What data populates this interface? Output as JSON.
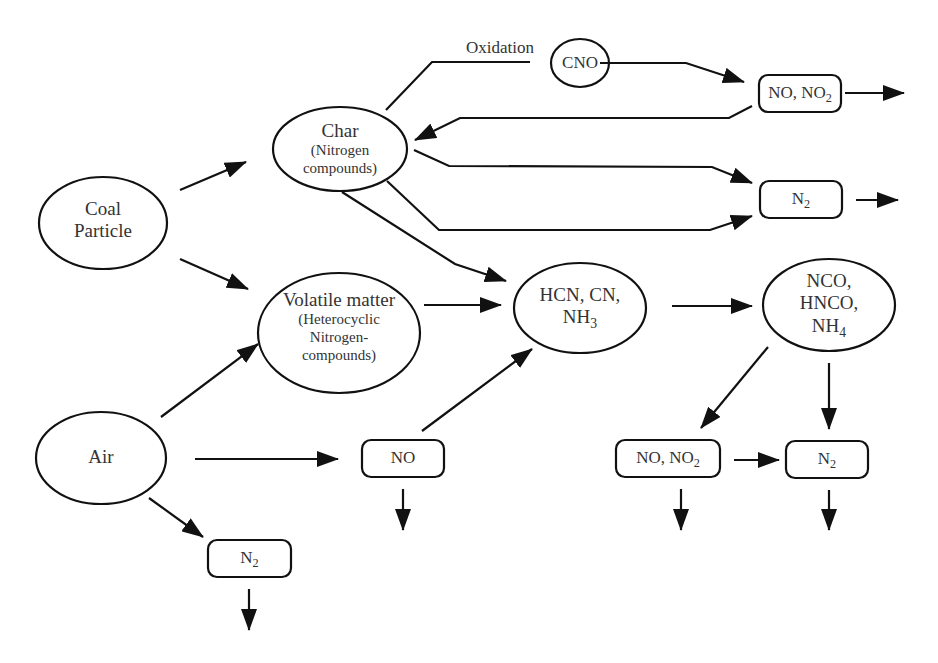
{
  "nodes": {
    "coal_particle": {
      "shape": "ellipse",
      "line1": "Coal",
      "line2": "Particle"
    },
    "air": {
      "shape": "ellipse",
      "line1": "Air"
    },
    "char": {
      "shape": "ellipse",
      "line1": "Char",
      "line2": "(Nitrogen",
      "line3": "compounds)"
    },
    "volatile": {
      "shape": "ellipse",
      "line1": "Volatile matter",
      "line2": "(Heterocyclic",
      "line3": "Nitrogen-",
      "line4": "compounds)"
    },
    "cno": {
      "shape": "ellipse",
      "line1": "CNO"
    },
    "hcn": {
      "shape": "ellipse",
      "line1": "HCN, CN,",
      "line2_base": "NH",
      "line2_sub": "3"
    },
    "nco": {
      "shape": "ellipse",
      "line1": "NCO,",
      "line2": "HNCO,",
      "line3_base": "NH",
      "line3_sub": "4"
    },
    "top_no_no2": {
      "shape": "rounded-box",
      "base": "NO, NO",
      "sub": "2"
    },
    "top_n2": {
      "shape": "rounded-box",
      "base": "N",
      "sub": "2"
    },
    "mid_no": {
      "shape": "rounded-box",
      "label": "NO"
    },
    "bottom_n2_left": {
      "shape": "rounded-box",
      "base": "N",
      "sub": "2"
    },
    "bottom_no_no2": {
      "shape": "rounded-box",
      "base": "NO, NO",
      "sub": "2"
    },
    "bottom_n2_right": {
      "shape": "rounded-box",
      "base": "N",
      "sub": "2"
    }
  },
  "edge_labels": {
    "oxidation": "Oxidation"
  },
  "edges": [
    {
      "from": "coal_particle",
      "to": "char"
    },
    {
      "from": "coal_particle",
      "to": "volatile"
    },
    {
      "from": "air",
      "to": "volatile"
    },
    {
      "from": "air",
      "to": "mid_no"
    },
    {
      "from": "air",
      "to": "bottom_n2_left"
    },
    {
      "from": "char",
      "to": "top_no_no2",
      "via": "cno",
      "label": "Oxidation"
    },
    {
      "from": "top_no_no2",
      "to": "char"
    },
    {
      "from": "char",
      "to": "top_n2"
    },
    {
      "from": "char",
      "to": "top_n2"
    },
    {
      "from": "char",
      "to": "hcn"
    },
    {
      "from": "volatile",
      "to": "hcn"
    },
    {
      "from": "mid_no",
      "to": "hcn"
    },
    {
      "from": "hcn",
      "to": "nco"
    },
    {
      "from": "nco",
      "to": "bottom_no_no2"
    },
    {
      "from": "nco",
      "to": "bottom_n2_right"
    },
    {
      "from": "bottom_no_no2",
      "to": "bottom_n2_right"
    },
    {
      "from": "top_no_no2",
      "to": "out"
    },
    {
      "from": "top_n2",
      "to": "out"
    },
    {
      "from": "mid_no",
      "to": "out"
    },
    {
      "from": "bottom_n2_left",
      "to": "out"
    },
    {
      "from": "bottom_no_no2",
      "to": "out"
    },
    {
      "from": "bottom_n2_right",
      "to": "out"
    }
  ],
  "colors": {
    "stroke": "#111111",
    "text": "#333333",
    "background": "#ffffff"
  }
}
